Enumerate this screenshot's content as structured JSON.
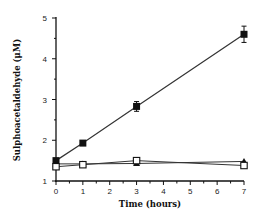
{
  "chart_data": {
    "type": "line",
    "title": "",
    "xlabel": "Time (hours)",
    "ylabel": "Sulphoacetaldehyde (μM)",
    "xlim": [
      0,
      7
    ],
    "ylim": [
      1,
      5
    ],
    "x_ticks": [
      0,
      1,
      2,
      3,
      4,
      5,
      6,
      7
    ],
    "y_ticks": [
      1,
      2,
      3,
      4,
      5
    ],
    "grid": false,
    "legend": null,
    "series": [
      {
        "name": "filled squares",
        "marker": "filled-square",
        "x": [
          0,
          1,
          3,
          7
        ],
        "values": [
          1.5,
          1.93,
          2.83,
          4.6
        ],
        "errors": [
          0.05,
          0.05,
          0.12,
          0.2
        ]
      },
      {
        "name": "filled triangles",
        "marker": "filled-triangle",
        "x": [
          0,
          1,
          3,
          7
        ],
        "values": [
          1.42,
          1.42,
          1.43,
          1.48
        ],
        "errors": [
          0,
          0,
          0,
          0
        ]
      },
      {
        "name": "open squares",
        "marker": "open-square",
        "x": [
          0,
          1,
          3,
          7
        ],
        "values": [
          1.35,
          1.4,
          1.5,
          1.38
        ],
        "errors": [
          0,
          0,
          0,
          0
        ]
      }
    ]
  }
}
